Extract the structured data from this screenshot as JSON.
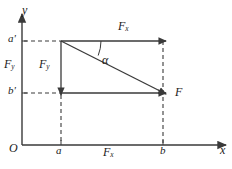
{
  "figure": {
    "background_color": "#ffffff",
    "line_color": "#3a3a3a",
    "text_color": "#1a1a1a"
  },
  "axes": {
    "y_label": "y",
    "x_label": "x",
    "origin_label": "O",
    "x_axis": {
      "from": [
        22,
        145
      ],
      "to": [
        228,
        145
      ]
    },
    "y_axis": {
      "from": [
        22,
        145
      ],
      "to": [
        22,
        12
      ]
    }
  },
  "ticks": {
    "x": [
      {
        "label": "a",
        "value_x": 61
      },
      {
        "label": "b",
        "value_x": 163
      }
    ],
    "y": [
      {
        "label": "a'",
        "value_y": 41
      },
      {
        "label": "b'",
        "value_y": 93
      }
    ]
  },
  "vectors": {
    "resultant": {
      "label": "F",
      "description": "resultant force vector from (a, a') to (b, b')",
      "from": [
        61,
        41
      ],
      "to": [
        163,
        93
      ]
    },
    "x_component_top": {
      "label": "F",
      "subscript": "x",
      "description": "horizontal component along the a' level",
      "from": [
        61,
        41
      ],
      "to": [
        163,
        41
      ]
    },
    "y_component": {
      "label": "F",
      "subscript": "y",
      "description": "vertical downward component at x = a",
      "from": [
        61,
        41
      ],
      "to": [
        61,
        93
      ]
    },
    "x_component_bottom": {
      "label": "F",
      "subscript": "x",
      "description": "horizontal component along the b' level",
      "from": [
        61,
        93
      ],
      "to": [
        163,
        93
      ]
    }
  },
  "angle": {
    "label": "α",
    "description": "angle between resultant F and horizontal Fx at vertex (a, a')"
  },
  "axis_component_labels": {
    "fy_on_y_axis": {
      "label": "F",
      "subscript": "y"
    },
    "fx_on_x_axis": {
      "label": "F",
      "subscript": "x"
    }
  },
  "dashed_guides": [
    {
      "name": "a-prime-horizontal",
      "from": [
        22,
        41
      ],
      "to": [
        61,
        41
      ]
    },
    {
      "name": "b-prime-horizontal",
      "from": [
        22,
        93
      ],
      "to": [
        61,
        93
      ]
    },
    {
      "name": "a-vertical",
      "from": [
        61,
        93
      ],
      "to": [
        61,
        145
      ]
    },
    {
      "name": "b-vertical",
      "from": [
        163,
        41
      ],
      "to": [
        163,
        145
      ]
    }
  ]
}
